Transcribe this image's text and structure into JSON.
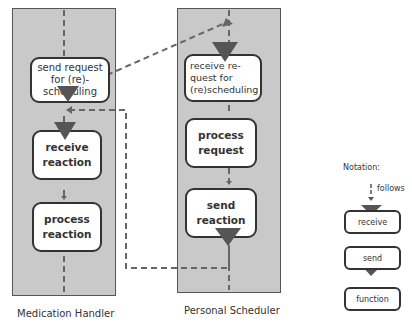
{
  "lanes": [
    {
      "label": "Medication Handler",
      "nodes": [
        {
          "id": "mh-send-request",
          "type": "send",
          "lines": [
            "send request",
            "for (re)-",
            "scheduling"
          ]
        },
        {
          "id": "mh-receive-reaction",
          "type": "receive",
          "lines": [
            "receive",
            "reaction"
          ]
        },
        {
          "id": "mh-process-reaction",
          "type": "function",
          "lines": [
            "process",
            "reaction"
          ]
        }
      ]
    },
    {
      "label": "Personal Scheduler",
      "nodes": [
        {
          "id": "ps-receive-request",
          "type": "receive",
          "lines": [
            "receive re-",
            "quest for",
            "(re)scheduling"
          ]
        },
        {
          "id": "ps-process-request",
          "type": "function",
          "lines": [
            "process",
            "request"
          ]
        },
        {
          "id": "ps-send-reaction",
          "type": "send",
          "lines": [
            "send",
            "reaction"
          ]
        }
      ]
    }
  ],
  "edges": [
    {
      "from": "mh-send-request",
      "to": "ps-receive-request",
      "kind": "message"
    },
    {
      "from": "ps-send-reaction",
      "to": "mh-receive-reaction",
      "kind": "message"
    },
    {
      "from": "mh-send-request",
      "to": "mh-receive-reaction",
      "kind": "follows"
    },
    {
      "from": "mh-receive-reaction",
      "to": "mh-process-reaction",
      "kind": "follows"
    },
    {
      "from": "ps-receive-request",
      "to": "ps-process-request",
      "kind": "follows"
    },
    {
      "from": "ps-process-request",
      "to": "ps-send-reaction",
      "kind": "follows"
    }
  ],
  "legend": {
    "title": "Notation:",
    "follows_label": "follows",
    "items": [
      {
        "type": "receive",
        "label": "receive"
      },
      {
        "type": "send",
        "label": "send"
      },
      {
        "type": "function",
        "label": "function"
      }
    ]
  },
  "colors": {
    "lane_fill": "#c9c9c9",
    "marker": "#555555",
    "dash": "#666666"
  }
}
